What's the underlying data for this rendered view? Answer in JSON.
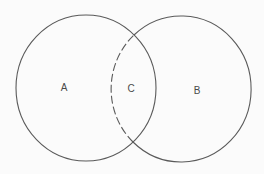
{
  "diagram": {
    "type": "venn",
    "stroke_color": "#5a5a5a",
    "background": "#fbfbfb",
    "sets": [
      {
        "id": "A",
        "label": "A",
        "cx": 86,
        "cy": 88,
        "rx": 70,
        "ry": 73
      },
      {
        "id": "B",
        "label": "B",
        "cx": 182,
        "cy": 89,
        "rx": 70,
        "ry": 73
      }
    ],
    "intersection": {
      "id": "C",
      "label": "C",
      "boundary_style": "dashed"
    },
    "labels": [
      {
        "text": "A",
        "x": 64,
        "y": 88
      },
      {
        "text": "C",
        "x": 131,
        "y": 89
      },
      {
        "text": "B",
        "x": 197,
        "y": 91
      }
    ]
  }
}
